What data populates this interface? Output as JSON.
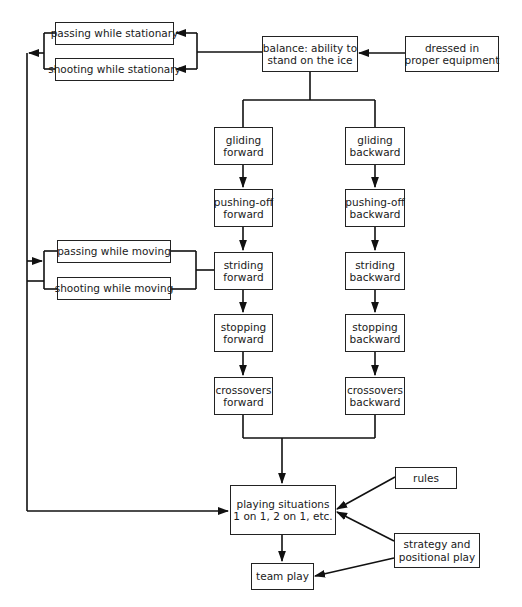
{
  "diagram": {
    "type": "flowchart",
    "nodes": {
      "passing_stationary": {
        "label": "passing while stationary"
      },
      "shooting_stationary": {
        "label": "shooting while stationary"
      },
      "balance": {
        "line1": "balance: ability to",
        "line2": "stand on the ice"
      },
      "dressed": {
        "line1": "dressed in",
        "line2": "proper equipment"
      },
      "gliding_forward": {
        "line1": "gliding",
        "line2": "forward"
      },
      "gliding_backward": {
        "line1": "gliding",
        "line2": "backward"
      },
      "pushing_off_forward": {
        "line1": "pushing-off",
        "line2": "forward"
      },
      "pushing_off_backward": {
        "line1": "pushing-off",
        "line2": "backward"
      },
      "passing_moving": {
        "label": "passing while moving"
      },
      "shooting_moving": {
        "label": "shooting while moving"
      },
      "striding_forward": {
        "line1": "striding",
        "line2": "forward"
      },
      "striding_backward": {
        "line1": "striding",
        "line2": "backward"
      },
      "stopping_forward": {
        "line1": "stopping",
        "line2": "forward"
      },
      "stopping_backward": {
        "line1": "stopping",
        "line2": "backward"
      },
      "crossovers_forward": {
        "line1": "crossovers",
        "line2": "forward"
      },
      "crossovers_backward": {
        "line1": "crossovers",
        "line2": "backward"
      },
      "playing_situations": {
        "line1": "playing situations",
        "line2": "1 on 1, 2 on 1, etc."
      },
      "rules": {
        "label": "rules"
      },
      "strategy": {
        "line1": "strategy and",
        "line2": "positional play"
      },
      "team_play": {
        "label": "team play"
      }
    },
    "edges": [
      [
        "dressed",
        "balance"
      ],
      [
        "balance",
        "passing_stationary"
      ],
      [
        "balance",
        "shooting_stationary"
      ],
      [
        "balance",
        "gliding_forward"
      ],
      [
        "balance",
        "gliding_backward"
      ],
      [
        "gliding_forward",
        "pushing_off_forward"
      ],
      [
        "pushing_off_forward",
        "striding_forward"
      ],
      [
        "striding_forward",
        "stopping_forward"
      ],
      [
        "stopping_forward",
        "crossovers_forward"
      ],
      [
        "gliding_backward",
        "pushing_off_backward"
      ],
      [
        "pushing_off_backward",
        "striding_backward"
      ],
      [
        "striding_backward",
        "stopping_backward"
      ],
      [
        "stopping_backward",
        "crossovers_backward"
      ],
      [
        "striding_forward",
        "passing_moving"
      ],
      [
        "striding_forward",
        "shooting_moving"
      ],
      [
        "passing_stationary",
        "passing_moving"
      ],
      [
        "shooting_stationary",
        "shooting_moving"
      ],
      [
        "passing_stationary",
        "playing_situations"
      ],
      [
        "crossovers_forward",
        "playing_situations"
      ],
      [
        "crossovers_backward",
        "playing_situations"
      ],
      [
        "rules",
        "playing_situations"
      ],
      [
        "strategy",
        "playing_situations"
      ],
      [
        "strategy",
        "team_play"
      ],
      [
        "playing_situations",
        "team_play"
      ]
    ]
  }
}
